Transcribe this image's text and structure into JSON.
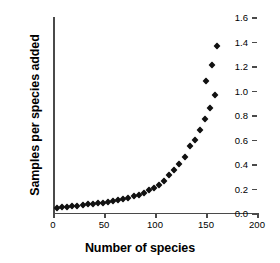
{
  "chart_data": {
    "type": "scatter",
    "title": "",
    "xlabel": "Number of species",
    "ylabel": "Samples per species added",
    "xlim": [
      0,
      200
    ],
    "ylim": [
      0.0,
      1.6
    ],
    "grid": false,
    "legend": "none",
    "marker": "filled-diamond",
    "marker_color": "#111111",
    "xticks": [
      "0",
      "50",
      "100",
      "150",
      "200"
    ],
    "xtick_values": [
      0,
      50,
      100,
      150,
      200
    ],
    "yticks": [
      "0.0",
      "0.2",
      "0.4",
      "0.6",
      "0.8",
      "1.0",
      "1.2",
      "1.4",
      "1.6"
    ],
    "ytick_values": [
      0.0,
      0.2,
      0.4,
      0.6,
      0.8,
      1.0,
      1.2,
      1.4,
      1.6
    ],
    "x": [
      4,
      9,
      14,
      19,
      24,
      29,
      34,
      39,
      44,
      49,
      54,
      59,
      64,
      69,
      74,
      79,
      84,
      89,
      94,
      99,
      104,
      109,
      114,
      119,
      124,
      129,
      134,
      139,
      144,
      149,
      154,
      159,
      161
    ],
    "values": [
      0.04,
      0.045,
      0.05,
      0.055,
      0.06,
      0.065,
      0.07,
      0.075,
      0.08,
      0.085,
      0.09,
      0.1,
      0.105,
      0.115,
      0.125,
      0.135,
      0.15,
      0.165,
      0.185,
      0.205,
      0.23,
      0.265,
      0.31,
      0.35,
      0.4,
      0.46,
      0.55,
      0.6,
      0.68,
      0.77,
      0.86,
      0.96,
      1.08
    ],
    "series_name": "samples per species added"
  },
  "extra_points": {
    "x": [
      150,
      156,
      161
    ],
    "values": [
      1.08,
      1.21,
      1.36
    ]
  }
}
